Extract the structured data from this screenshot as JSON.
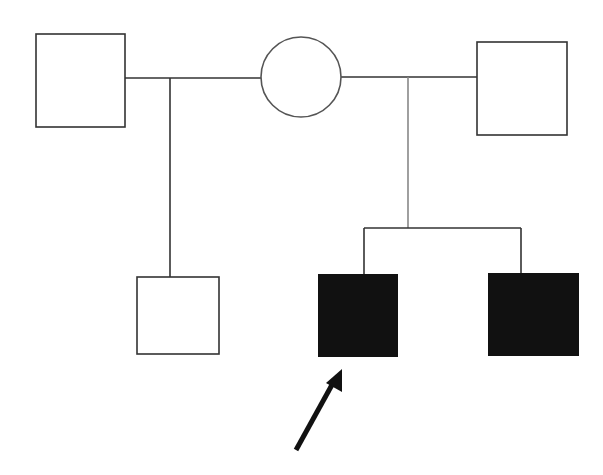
{
  "diagram": {
    "type": "pedigree",
    "colors": {
      "line": "#333333",
      "affected": "#111111",
      "unaffected": "#ffffff"
    },
    "individuals": [
      {
        "id": "I-1",
        "shape": "square",
        "sex": "male",
        "affected": false,
        "label": "first partner"
      },
      {
        "id": "I-2",
        "shape": "circle",
        "sex": "female",
        "affected": false,
        "label": "mother"
      },
      {
        "id": "I-3",
        "shape": "square",
        "sex": "male",
        "affected": false,
        "label": "second partner"
      },
      {
        "id": "II-1",
        "shape": "square",
        "sex": "male",
        "affected": false,
        "label": "half-sibling"
      },
      {
        "id": "II-2",
        "shape": "square",
        "sex": "male",
        "affected": true,
        "proband": true,
        "label": "proband"
      },
      {
        "id": "II-3",
        "shape": "square",
        "sex": "male",
        "affected": true,
        "label": "affected brother"
      }
    ],
    "proband_marker": "arrow"
  }
}
